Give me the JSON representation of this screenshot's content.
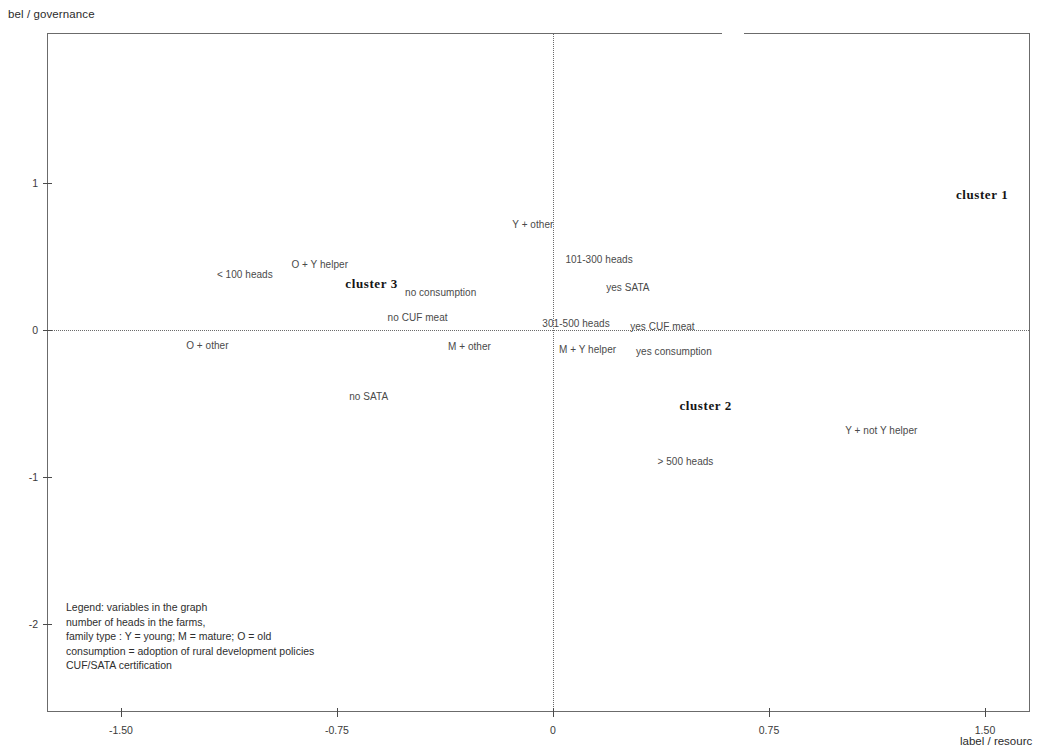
{
  "axes": {
    "y_title": "bel / governance",
    "x_title": "label / resourc",
    "x_ticks": [
      "-1.50",
      "-0.75",
      "0",
      "0.75",
      "1.50"
    ],
    "y_ticks": [
      "1",
      "0",
      "-1",
      "-2"
    ]
  },
  "legend": {
    "lines": [
      "Legend: variables in the graph",
      "number of heads in the farms,",
      "family type : Y = young; M = mature; O = old",
      "consumption = adoption of rural development policies",
      "CUF/SATA certification"
    ]
  },
  "clusters": [
    {
      "label": "cluster 1",
      "x": 1.49,
      "y": 0.92
    },
    {
      "label": "cluster 2",
      "x": 0.53,
      "y": -0.52
    },
    {
      "label": "cluster 3",
      "x": -0.63,
      "y": 0.31
    }
  ],
  "chart_data": {
    "type": "scatter",
    "title": "",
    "xlabel": "label / resourc",
    "ylabel": "bel / governance",
    "xlim": [
      -1.76,
      1.66
    ],
    "ylim": [
      -2.59,
      2.02
    ],
    "xticks": [
      -1.5,
      -0.75,
      0,
      0.75,
      1.5
    ],
    "yticks": [
      1,
      0,
      -1,
      -2
    ],
    "grid": false,
    "legend_position": "bottom-left",
    "reference_lines": {
      "vertical_x": 0,
      "horizontal_y": 0
    },
    "points": [
      {
        "label": "< 100 heads",
        "x": -1.07,
        "y": 0.38
      },
      {
        "label": "O + Y helper",
        "x": -0.81,
        "y": 0.45
      },
      {
        "label": "no consumption",
        "x": -0.39,
        "y": 0.26
      },
      {
        "label": "no CUF meat",
        "x": -0.47,
        "y": 0.09
      },
      {
        "label": "O + other",
        "x": -1.2,
        "y": -0.1
      },
      {
        "label": "M + other",
        "x": -0.29,
        "y": -0.11
      },
      {
        "label": "no SATA",
        "x": -0.64,
        "y": -0.45
      },
      {
        "label": "Y + other",
        "x": -0.07,
        "y": 0.72
      },
      {
        "label": "101-300 heads",
        "x": 0.16,
        "y": 0.48
      },
      {
        "label": "yes SATA",
        "x": 0.26,
        "y": 0.29
      },
      {
        "label": "301-500 heads",
        "x": 0.08,
        "y": 0.05
      },
      {
        "label": "yes CUF meat",
        "x": 0.38,
        "y": 0.03
      },
      {
        "label": "M + Y helper",
        "x": 0.12,
        "y": -0.13
      },
      {
        "label": "yes consumption",
        "x": 0.42,
        "y": -0.14
      },
      {
        "label": "> 500 heads",
        "x": 0.46,
        "y": -0.89
      },
      {
        "label": "Y + not Y helper",
        "x": 1.14,
        "y": -0.68
      }
    ],
    "annotations": [
      {
        "text": "cluster 1",
        "x": 1.49,
        "y": 0.92
      },
      {
        "text": "cluster 2",
        "x": 0.53,
        "y": -0.52
      },
      {
        "text": "cluster 3",
        "x": -0.63,
        "y": 0.31
      }
    ]
  }
}
